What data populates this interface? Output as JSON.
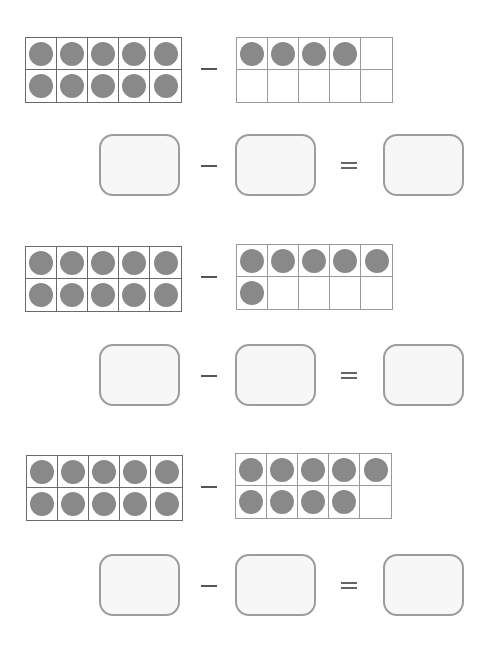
{
  "worksheet": {
    "problems": [
      {
        "minuend_dots": 10,
        "subtrahend_dots": 4,
        "minus_symbol": "−",
        "equals_symbol": "=",
        "answer_boxes": [
          "",
          "",
          ""
        ]
      },
      {
        "minuend_dots": 10,
        "subtrahend_dots": 6,
        "minus_symbol": "−",
        "equals_symbol": "=",
        "answer_boxes": [
          "",
          "",
          ""
        ]
      },
      {
        "minuend_dots": 10,
        "subtrahend_dots": 9,
        "minus_symbol": "−",
        "equals_symbol": "=",
        "answer_boxes": [
          "",
          "",
          ""
        ]
      }
    ],
    "colors": {
      "dot": "#898989",
      "grid": "#6a6a6a",
      "box_border": "#9c9c9c",
      "box_fill": "#f7f7f7"
    }
  }
}
